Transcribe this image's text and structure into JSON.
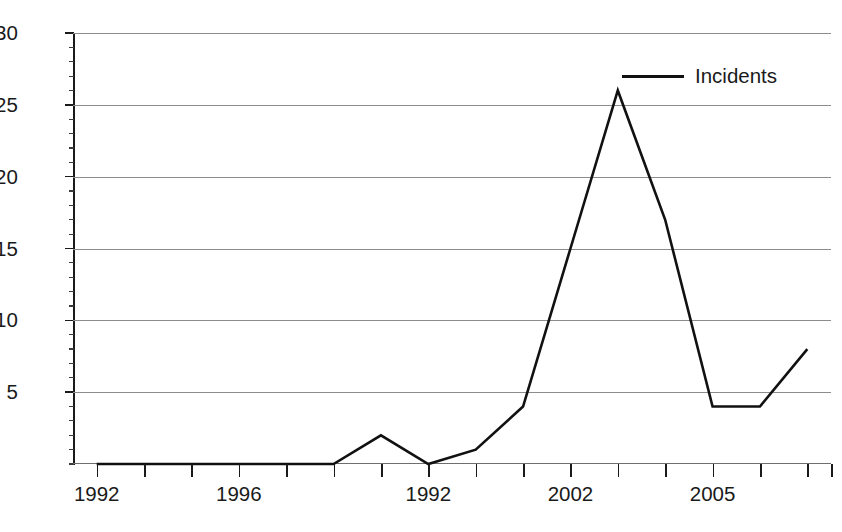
{
  "chart_data": {
    "type": "line",
    "title": "",
    "xlabel": "",
    "ylabel": "",
    "ylim": [
      0,
      30
    ],
    "y_ticks": [
      0,
      5,
      10,
      15,
      20,
      25,
      30
    ],
    "y_tick_labels": [
      "5",
      "10",
      "15",
      "20",
      "25",
      "30"
    ],
    "y_minor_tick_step": 1,
    "grid": "horizontal",
    "legend_position": "top-right",
    "x_tick_count": 16,
    "x_tick_labels": [
      {
        "index": 1,
        "label": "1992"
      },
      {
        "index": 4,
        "label": "1996"
      },
      {
        "index": 8,
        "label": "1992"
      },
      {
        "index": 11,
        "label": "2002"
      },
      {
        "index": 14,
        "label": "2005"
      }
    ],
    "x": [
      1,
      2,
      3,
      4,
      5,
      6,
      7,
      8,
      9,
      10,
      11,
      12,
      13,
      14,
      15,
      16
    ],
    "series": [
      {
        "name": "Incidents",
        "color": "#111111",
        "values": [
          0,
          0,
          0,
          0,
          0,
          0,
          2,
          0,
          1,
          4,
          15,
          26,
          17,
          4,
          4,
          8
        ]
      }
    ],
    "annotations": []
  },
  "legend": {
    "entries": [
      {
        "label": "Incidents",
        "color": "#111111"
      }
    ]
  },
  "colors": {
    "series_line": "#111111",
    "gridline": "#8c8c8c",
    "axis": "#1a1a1a",
    "background": "#ffffff"
  }
}
